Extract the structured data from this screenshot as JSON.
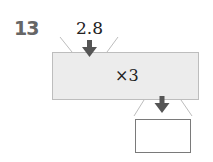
{
  "problem": {
    "number": "13",
    "input_value": "2.8",
    "operation": "×3",
    "output_value": ""
  },
  "colors": {
    "machine_fill": "#ececec",
    "arrow": "#555555",
    "number_label": "#666666"
  }
}
